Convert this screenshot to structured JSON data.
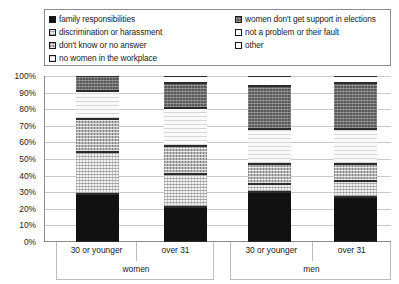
{
  "legend": {
    "left_items": [
      {
        "label": "family responsibilities",
        "pattern": "black",
        "color": "#111111"
      },
      {
        "label": "discrimination or harassment",
        "pattern": "lightdot",
        "color": "#f2f2f2"
      },
      {
        "label": "don't know or no answer",
        "pattern": "graydot",
        "color": "#b7b7b7"
      },
      {
        "label": "no women in the workplace",
        "pattern": "vlight",
        "color": "#fafafa"
      }
    ],
    "right_items": [
      {
        "label": "women don't get support in elections",
        "pattern": "darkgray",
        "color": "#595959"
      },
      {
        "label": "not a problem or their fault",
        "pattern": "white",
        "color": "#ffffff"
      },
      {
        "label": "other",
        "pattern": "white2",
        "color": "#ffffff"
      }
    ]
  },
  "yaxis": {
    "ticks": [
      "100%",
      "90%",
      "80%",
      "70%",
      "60%",
      "50%",
      "40%",
      "30%",
      "20%",
      "10%",
      "0%"
    ],
    "min": 0,
    "max": 100
  },
  "xaxis": {
    "groups": [
      {
        "label": "women",
        "categories": [
          "30 or younger",
          "over 31"
        ]
      },
      {
        "label": "men",
        "categories": [
          "30 or younger",
          "over 31"
        ]
      }
    ]
  },
  "chart_data": {
    "type": "bar",
    "stacked": true,
    "title": "",
    "xlabel": "",
    "ylabel": "",
    "ylim": [
      0,
      100
    ],
    "grid": true,
    "legend_position": "top",
    "categories": [
      "women / 30 or younger",
      "women / over 31",
      "men / 30 or younger",
      "men / over 31"
    ],
    "series": [
      {
        "name": "family responsibilities",
        "pattern": "black",
        "values": [
          29,
          21,
          30,
          27
        ]
      },
      {
        "name": "discrimination or harassment",
        "pattern": "lightdot",
        "values": [
          25,
          20,
          5,
          10
        ]
      },
      {
        "name": "don't know or no answer",
        "pattern": "graydot",
        "values": [
          20,
          17,
          12,
          10
        ]
      },
      {
        "name": "no women in the workplace",
        "pattern": "vlight",
        "values": [
          17,
          23,
          21,
          21
        ]
      },
      {
        "name": "women don't get support in elections",
        "pattern": "darkgray",
        "values": [
          9,
          15,
          26,
          28
        ]
      },
      {
        "name": "not a problem or their fault",
        "pattern": "white",
        "values": [
          0,
          4,
          6,
          0
        ]
      },
      {
        "name": "other",
        "pattern": "white2",
        "values": [
          0,
          0,
          0,
          4
        ]
      }
    ]
  }
}
